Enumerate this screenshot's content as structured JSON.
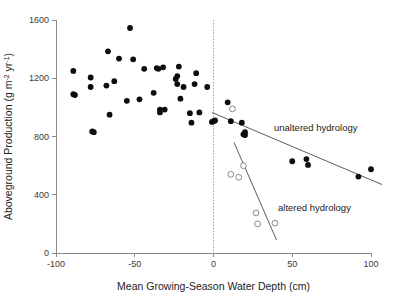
{
  "chart_data": {
    "type": "scatter",
    "title": "",
    "xlabel": "Mean Growing-Season Water Depth (cm)",
    "ylabel": "Aboveground Production (g m-2 yr-1)",
    "ylabel_parts": {
      "lead": "Aboveground Production (g m",
      "sup1": "-2",
      "mid": " yr",
      "sup2": "-1",
      "tail": ")"
    },
    "xlim": [
      -100,
      100
    ],
    "ylim": [
      0,
      1600
    ],
    "xticks": [
      -100,
      -50,
      0,
      50,
      100
    ],
    "xtick_labels": [
      "-100",
      "-50",
      "0",
      "50",
      "100"
    ],
    "yticks": [
      0,
      400,
      800,
      1200,
      1600
    ],
    "ytick_labels": [
      "0",
      "400",
      "800",
      "1200",
      "1600"
    ],
    "grid": false,
    "legend_position": "inline-annotations",
    "reference_line": {
      "name": "zero-water-depth",
      "orientation": "vertical",
      "x": 0,
      "style": "dotted",
      "color": "#9a9a9a"
    },
    "series": [
      {
        "name": "unaltered hydrology",
        "marker": "filled-circle",
        "color": "#0d0d0d",
        "points": [
          [
            -89,
            1250
          ],
          [
            -89,
            1090
          ],
          [
            -88,
            1085
          ],
          [
            -78,
            1205
          ],
          [
            -78,
            1140
          ],
          [
            -77,
            835
          ],
          [
            -76,
            830
          ],
          [
            -68,
            1150
          ],
          [
            -67,
            1385
          ],
          [
            -66,
            950
          ],
          [
            -63,
            1180
          ],
          [
            -60,
            1335
          ],
          [
            -55,
            1045
          ],
          [
            -53,
            1545
          ],
          [
            -51,
            1330
          ],
          [
            -47,
            1055
          ],
          [
            -44,
            1265
          ],
          [
            -38,
            1100
          ],
          [
            -36,
            1270
          ],
          [
            -35,
            1265
          ],
          [
            -34,
            985
          ],
          [
            -34,
            965
          ],
          [
            -32,
            1275
          ],
          [
            -31,
            985
          ],
          [
            -24,
            1195
          ],
          [
            -23,
            1160
          ],
          [
            -23,
            1215
          ],
          [
            -22,
            1280
          ],
          [
            -21,
            1060
          ],
          [
            -19,
            1140
          ],
          [
            -15,
            960
          ],
          [
            -14,
            895
          ],
          [
            -12,
            1160
          ],
          [
            -11,
            1235
          ],
          [
            -9,
            965
          ],
          [
            -4,
            1140
          ],
          [
            -1,
            900
          ],
          [
            0,
            905
          ],
          [
            1,
            910
          ],
          [
            9,
            1035
          ],
          [
            11,
            905
          ],
          [
            18,
            895
          ],
          [
            19,
            815
          ],
          [
            20,
            810
          ],
          [
            20,
            830
          ],
          [
            50,
            630
          ],
          [
            59,
            645
          ],
          [
            60,
            605
          ],
          [
            92,
            525
          ],
          [
            100,
            575
          ]
        ],
        "fit_line": {
          "x1": -1,
          "y1": 965,
          "x2": 107,
          "y2": 470
        }
      },
      {
        "name": "altered hydrology",
        "marker": "open-circle",
        "color": "#7d7d7d",
        "points": [
          [
            12,
            990
          ],
          [
            11,
            540
          ],
          [
            16,
            520
          ],
          [
            19,
            600
          ],
          [
            27,
            275
          ],
          [
            28,
            200
          ],
          [
            39,
            205
          ]
        ],
        "fit_line": {
          "x1": 13,
          "y1": 760,
          "x2": 40,
          "y2": 90
        }
      }
    ],
    "annotations": [
      {
        "name": "unaltered-hydrology-label",
        "text": "unaltered hydrology",
        "x_px": 274,
        "y_px": 131
      },
      {
        "name": "altered-hydrology-label",
        "text": "altered hydrology",
        "x_px": 278,
        "y_px": 211
      }
    ]
  }
}
